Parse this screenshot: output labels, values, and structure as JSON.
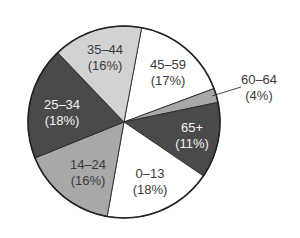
{
  "chart_data": {
    "type": "pie",
    "title": "",
    "categories": [
      "45–59",
      "60–64",
      "65+",
      "0–13",
      "14–24",
      "25–34",
      "35–44"
    ],
    "values": [
      17,
      4,
      11,
      18,
      16,
      18,
      16
    ],
    "unit": "%",
    "labels": [
      {
        "name": "45–59",
        "pct": "(17%)"
      },
      {
        "name": "60–64",
        "pct": "(4%)"
      },
      {
        "name": "65+",
        "pct": "(11%)"
      },
      {
        "name": "0–13",
        "pct": "(18%)"
      },
      {
        "name": "14–24",
        "pct": "(16%)"
      },
      {
        "name": "25–34",
        "pct": "(18%)"
      },
      {
        "name": "35–44",
        "pct": "(16%)"
      }
    ],
    "legend": "none (labels placed on slices; 60–64 uses a leader line)",
    "start_angle_deg": 10.6,
    "direction": "clockwise"
  },
  "style": {
    "colors": {
      "white": "#ffffff",
      "light_gray": "#d2d2d2",
      "medium_gray": "#a8a8a8",
      "dark_gray": "#4a4a4a",
      "outline": "#222222"
    }
  },
  "slices": [
    {
      "key": "45-59",
      "start": 10.6,
      "end": 69.6,
      "fill": "#ffffff",
      "text": "dark",
      "lx": 168,
      "ly": 65
    },
    {
      "key": "60-64",
      "start": 69.6,
      "end": 78.2,
      "fill": "#a8a8a8",
      "text": "dark",
      "lx": 259,
      "ly": 80
    },
    {
      "key": "65+",
      "start": 78.2,
      "end": 124.2,
      "fill": "#4a4a4a",
      "text": "light",
      "lx": 192,
      "ly": 128
    },
    {
      "key": "0-13",
      "start": 124.2,
      "end": 190.1,
      "fill": "#ffffff",
      "text": "dark",
      "lx": 150,
      "ly": 174
    },
    {
      "key": "14-24",
      "start": 190.1,
      "end": 248.0,
      "fill": "#a8a8a8",
      "text": "dark",
      "lx": 88,
      "ly": 165
    },
    {
      "key": "25-34",
      "start": 248.0,
      "end": 316.3,
      "fill": "#4a4a4a",
      "text": "light",
      "lx": 62,
      "ly": 105
    },
    {
      "key": "35-44",
      "start": 316.3,
      "end": 370.6,
      "fill": "#d2d2d2",
      "text": "dark",
      "lx": 105,
      "ly": 50
    }
  ],
  "geometry": {
    "cx": 124,
    "cy": 122,
    "r": 96
  },
  "leader_line": {
    "x1": 212,
    "y1": 96,
    "x2": 241,
    "y2": 87
  }
}
